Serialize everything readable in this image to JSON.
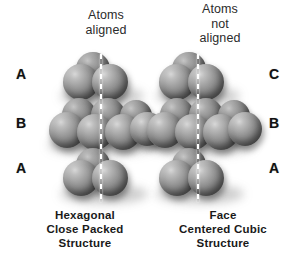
{
  "figure": {
    "background_color": "#ffffff",
    "sphere_color": "#8a8a8a",
    "sphere_highlight_color": "#d0d0d0",
    "sphere_shadow_color": "#4a4a4a",
    "label_color": "#111111",
    "guide_line_color": "#ffffff"
  },
  "columns": [
    {
      "id": "hcp",
      "heading_lines": [
        "Atoms",
        "aligned"
      ],
      "caption_lines": [
        "Hexagonal",
        "Close Packed",
        "Structure"
      ],
      "label_side": "left",
      "layer_labels": [
        "A",
        "B",
        "A"
      ],
      "layers": [
        {
          "label": "A",
          "position": "top",
          "atom_count": 3,
          "offset": "aligned"
        },
        {
          "label": "B",
          "position": "middle",
          "atom_count": 7,
          "offset": "aligned"
        },
        {
          "label": "A",
          "position": "bottom",
          "atom_count": 3,
          "offset": "aligned"
        }
      ]
    },
    {
      "id": "fcc",
      "heading_lines": [
        "Atoms",
        "not",
        "aligned"
      ],
      "caption_lines": [
        "Face",
        "Centered Cubic",
        "Structure"
      ],
      "label_side": "right",
      "layer_labels": [
        "C",
        "B",
        "A"
      ],
      "layers": [
        {
          "label": "C",
          "position": "top",
          "atom_count": 3,
          "offset": "shifted"
        },
        {
          "label": "B",
          "position": "middle",
          "atom_count": 7,
          "offset": "aligned"
        },
        {
          "label": "A",
          "position": "bottom",
          "atom_count": 3,
          "offset": "shifted"
        }
      ]
    }
  ],
  "headings": {
    "left": {
      "line1": "Atoms",
      "line2": "aligned"
    },
    "right": {
      "line1": "Atoms",
      "line2": "not",
      "line3": "aligned"
    }
  },
  "labels": {
    "left": {
      "l0": "A",
      "l1": "B",
      "l2": "A"
    },
    "right": {
      "r0": "C",
      "r1": "B",
      "r2": "A"
    }
  },
  "captions": {
    "left": {
      "line1": "Hexagonal",
      "line2": "Close Packed",
      "line3": "Structure"
    },
    "right": {
      "line1": "Face",
      "line2": "Centered Cubic",
      "line3": "Structure"
    }
  }
}
